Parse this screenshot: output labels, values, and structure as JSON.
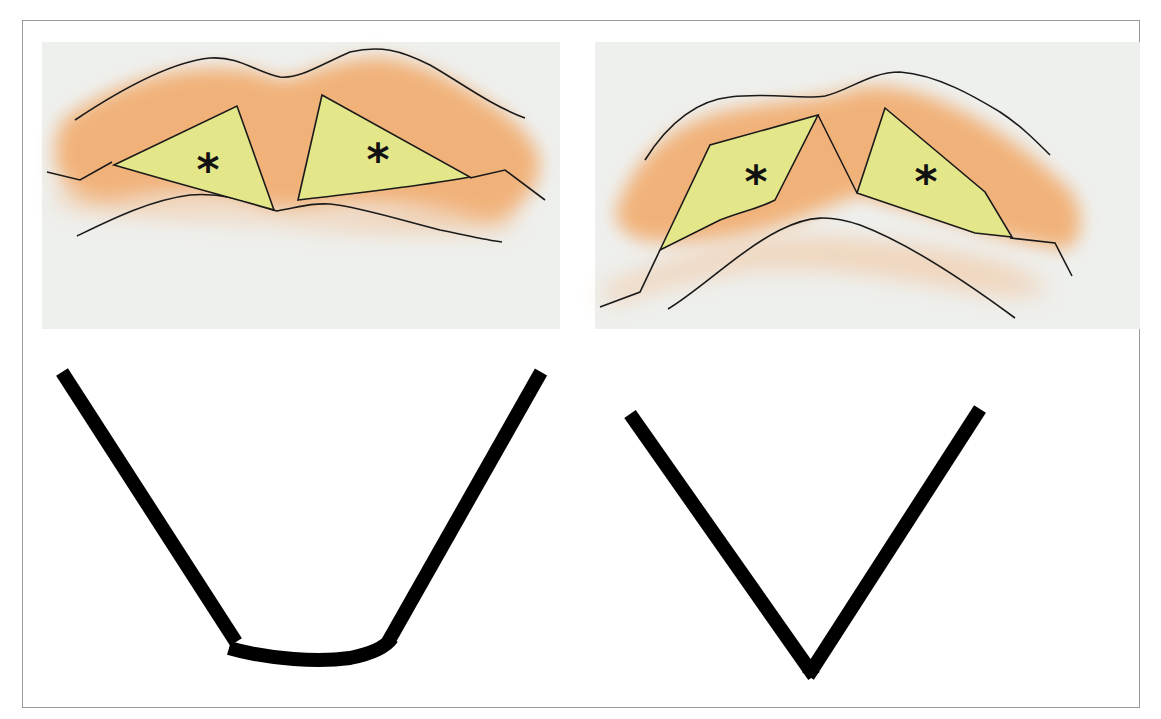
{
  "figure": {
    "panels": [
      {
        "id": "top-left",
        "description": "Cross-section with two yellow wedge regions separated by a wide central cleft",
        "markers": [
          "*",
          "*"
        ]
      },
      {
        "id": "top-right",
        "description": "Cross-section with two yellow quadrilateral regions on an arched base",
        "markers": [
          "*",
          "*"
        ]
      },
      {
        "id": "bottom-left",
        "description": "Schematic U-shape with flat curved base"
      },
      {
        "id": "bottom-right",
        "description": "Schematic V-shape with pointed apex"
      }
    ],
    "colors": {
      "background": "#ffffff",
      "panel_bg": "#eef0ee",
      "orange_band": "#f2a866",
      "yellow_region": "#e4e68a",
      "outline": "#1a1a1a",
      "frame_border": "#9a9a9a"
    }
  }
}
